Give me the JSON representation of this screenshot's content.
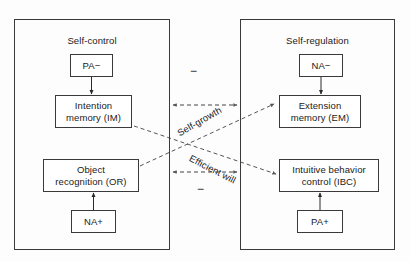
{
  "diagram": {
    "panels": [
      {
        "id": "self-control",
        "label": "Self-control",
        "nodes": [
          {
            "id": "pa-minus",
            "label": "PA−"
          },
          {
            "id": "intention-memory",
            "label": "Intention\nmemory (IM)",
            "line1": "Intention",
            "line2": "memory (IM)"
          },
          {
            "id": "object-recognition",
            "label": "Object\nrecognition (OR)",
            "line1": "Object",
            "line2": "recognition (OR)"
          },
          {
            "id": "na-plus",
            "label": "NA+"
          }
        ]
      },
      {
        "id": "self-regulation",
        "label": "Self-regulation",
        "nodes": [
          {
            "id": "na-minus",
            "label": "NA−"
          },
          {
            "id": "extension-memory",
            "label": "Extension\nmemory (EM)",
            "line1": "Extension",
            "line2": "memory (EM)"
          },
          {
            "id": "intuitive-behavior-control",
            "label": "Intuitive behavior\ncontrol (IBC)",
            "line1": "Intuitive behavior",
            "line2": "control (IBC)"
          },
          {
            "id": "pa-plus",
            "label": "PA+"
          }
        ]
      }
    ],
    "connector_labels": {
      "minus_top": "−",
      "minus_bottom": "−",
      "self_growth": "Self-growth",
      "efficient_will": "Efficient will"
    },
    "colors": {
      "stroke": "#3a3a3a",
      "text": "#1a1a1a",
      "background": "#fdfdfd"
    }
  }
}
